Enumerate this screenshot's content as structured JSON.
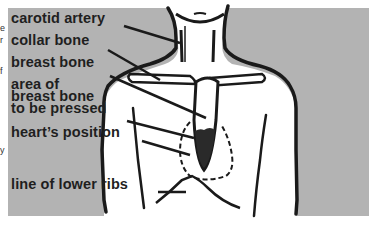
{
  "diagram": {
    "title": "",
    "background_color": "#b3b3b3",
    "line_color": "#1a1a1a",
    "labels": [
      {
        "id": "carotid",
        "text": "carotid artery",
        "target": "neck / carotid artery"
      },
      {
        "id": "collar",
        "text": "collar bone",
        "target": "clavicle"
      },
      {
        "id": "breast",
        "text": "breast bone",
        "target": "sternum"
      },
      {
        "id": "area1",
        "text": "area of",
        "target": "lower sternum"
      },
      {
        "id": "area2",
        "text": "breast bone",
        "target": "lower sternum"
      },
      {
        "id": "area3",
        "text": "to be pressed",
        "target": "lower sternum"
      },
      {
        "id": "heart",
        "text": "heart’s position",
        "target": "dashed heart outline"
      },
      {
        "id": "ribs",
        "text": "line of lower ribs",
        "target": "costal margin"
      }
    ],
    "edge_fragments": [
      "e",
      "r",
      "f",
      "y"
    ]
  }
}
